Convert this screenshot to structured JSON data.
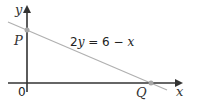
{
  "diagram": {
    "axes": {
      "x_label": "x",
      "y_label": "y",
      "origin_label": "0"
    },
    "line": {
      "equation_parts": [
        "2",
        "y",
        " = 6 − ",
        "x"
      ],
      "equation": "2y = 6 − x",
      "color": "#b0b0b0"
    },
    "points": [
      {
        "label": "P",
        "position": "y-intercept",
        "color": "#a8a8a8"
      },
      {
        "label": "Q",
        "position": "x-intercept",
        "color": "#a8a8a8"
      }
    ],
    "axis_color": "#333333"
  }
}
